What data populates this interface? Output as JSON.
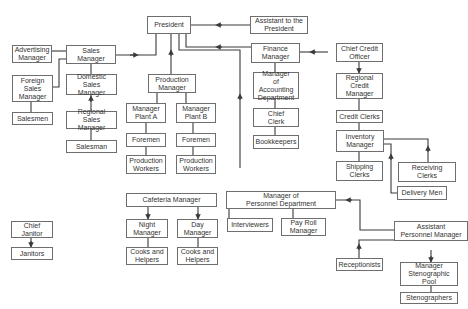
{
  "diagram": {
    "type": "organizational-chart",
    "nodes": {
      "president": "President",
      "assistant_president": "Assistant to the\nPresident",
      "advertising_manager": "Advertising\nManager",
      "sales_manager": "Sales\nManager",
      "foreign_sales_manager": "Foreign\nSales\nManager",
      "domestic_sales_manager": "Domestic\nSales Manager",
      "salesmen": "Salesmen",
      "regional_sales_manager": "Regional Sales\nManager",
      "salesman": "Salesman",
      "production_manager": "Production\nManager",
      "manager_plant_a": "Manager\nPlant A",
      "manager_plant_b": "Manager\nPlant B",
      "foremen_a": "Foremen",
      "foremen_b": "Foremen",
      "production_workers_a": "Production\nWorkers",
      "production_workers_b": "Production\nWorkers",
      "finance_manager": "Finance\nManager",
      "manager_accounting": "Manager\nof Accounting\nDepartment",
      "chief_clerk": "Chief\nClerk",
      "bookkeepers": "Bookkeepers",
      "chief_credit_officer": "Chief Credit\nOfficer",
      "regional_credit_manager": "Regional\nCredit\nManager",
      "credit_clerks": "Credit Clerks",
      "inventory_manager": "Inventory\nManager",
      "shipping_clerks": "Shipping\nClerks",
      "receiving_clerks": "Receiving\nClerks",
      "delivery_men": "Delivery Men",
      "chief_janitor": "Chief\nJanitor",
      "janitors": "Janitors",
      "cafeteria_manager": "Cafeteria Manager",
      "night_manager": "Night\nManager",
      "day_manager": "Day\nManager",
      "cooks_helpers_night": "Cooks and\nHelpers",
      "cooks_helpers_day": "Cooks and\nHelpers",
      "manager_personnel": "Manager of\nPersonnel Department",
      "interviewers": "Interviewers",
      "payroll_manager": "Pay Roll\nManager",
      "assistant_personnel_manager": "Assistant\nPersonnel Manager",
      "receptionists": "Receptionists",
      "manager_steno_pool": "Manager\nStenographic\nPool",
      "stenographers": "Stenographers"
    },
    "colors": {
      "line": "#3a3a3a",
      "border": "#6e6e6e",
      "text": "#333333",
      "background": "#ffffff"
    }
  }
}
